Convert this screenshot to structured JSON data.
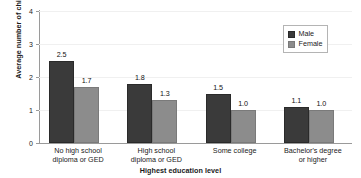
{
  "chart_data": {
    "type": "bar",
    "title": "",
    "xlabel": "Highest education level",
    "ylabel": "Average number of children",
    "ylim": [
      0,
      4
    ],
    "yticks": [
      0,
      1,
      2,
      3,
      4
    ],
    "ytick_labels": [
      "0",
      "1",
      "2",
      "3",
      "4"
    ],
    "grid": true,
    "legend_position": "top-right",
    "categories": [
      "No high school\ndiploma or GED",
      "High school\ndiploma or GED",
      "Some college",
      "Bachelor's degree\nor higher"
    ],
    "series": [
      {
        "name": "Male",
        "color": "#3a3a3a",
        "values": [
          2.5,
          1.8,
          1.5,
          1.1
        ],
        "value_labels": [
          "2.5",
          "1.8",
          "1.5",
          "1.1"
        ]
      },
      {
        "name": "Female",
        "color": "#8c8c8c",
        "values": [
          1.7,
          1.3,
          1.0,
          1.0
        ],
        "value_labels": [
          "1.7",
          "1.3",
          "1.0",
          "1.0"
        ]
      }
    ]
  }
}
